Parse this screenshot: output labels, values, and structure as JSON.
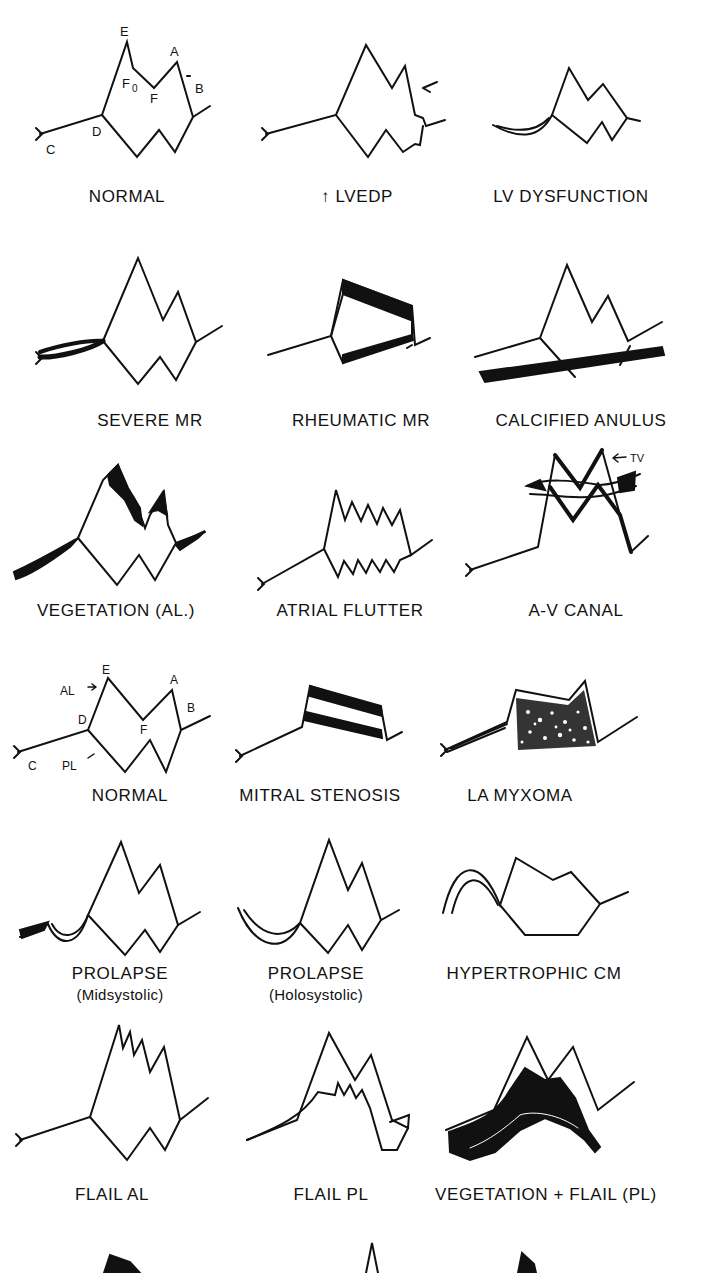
{
  "figure": {
    "ink_color": "#111111",
    "background": "#ffffff",
    "panels": [
      {
        "label": "NORMAL",
        "point_labels": [
          "E",
          "A",
          "F0",
          "F",
          "B",
          "D",
          "C"
        ]
      },
      {
        "label": "↑ LVEDP"
      },
      {
        "label": "LV DYSFUNCTION"
      },
      {
        "label": "SEVERE MR"
      },
      {
        "label": "RHEUMATIC MR"
      },
      {
        "label": "CALCIFIED ANULUS"
      },
      {
        "label": "VEGETATION (AL.)"
      },
      {
        "label": "ATRIAL FLUTTER"
      },
      {
        "label": "A-V CANAL",
        "annotation": "TV"
      },
      {
        "label": "NORMAL",
        "point_labels": [
          "E",
          "A",
          "AL",
          "B",
          "D",
          "F",
          "C",
          "PL"
        ]
      },
      {
        "label": "MITRAL STENOSIS"
      },
      {
        "label": "LA MYXOMA"
      },
      {
        "label": "PROLAPSE",
        "sublabel": "(Midsystolic)"
      },
      {
        "label": "PROLAPSE",
        "sublabel": "(Holosystolic)"
      },
      {
        "label": "HYPERTROPHIC CM"
      },
      {
        "label": "FLAIL AL"
      },
      {
        "label": "FLAIL PL"
      },
      {
        "label": "VEGETATION + FLAIL (PL)"
      }
    ],
    "pts": {
      "E": "E",
      "A": "A",
      "F0": "F",
      "F0_sub": "0",
      "F": "F",
      "B": "B",
      "D": "D",
      "C": "C",
      "AL": "AL",
      "PL": "PL",
      "TV": "TV"
    }
  }
}
